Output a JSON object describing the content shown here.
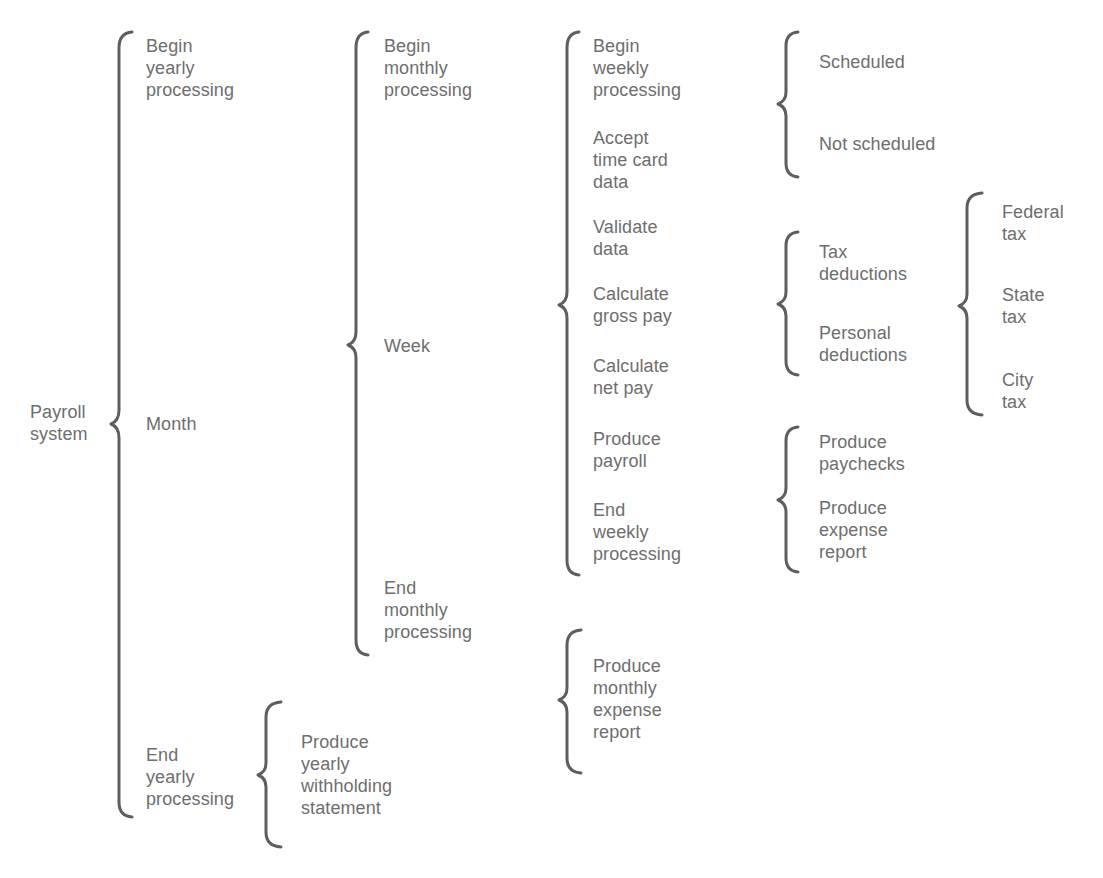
{
  "diagram": {
    "type": "Warnier-Orr diagram",
    "root": {
      "label": "Payroll\nsystem",
      "children": [
        {
          "label": "Begin\nyearly\nprocessing"
        },
        {
          "label": "Month",
          "children": [
            {
              "label": "Begin\nmonthly\nprocessing"
            },
            {
              "label": "Week",
              "children": [
                {
                  "label": "Begin\nweekly\nprocessing",
                  "children": [
                    {
                      "label": "Scheduled"
                    },
                    {
                      "label": "Not scheduled"
                    }
                  ]
                },
                {
                  "label": "Accept\ntime card\ndata"
                },
                {
                  "label": "Validate\ndata"
                },
                {
                  "label": "Calculate\ngross pay",
                  "children": [
                    {
                      "label": "Tax\ndeductions",
                      "children": [
                        {
                          "label": "Federal\ntax"
                        },
                        {
                          "label": "State\ntax"
                        },
                        {
                          "label": "City\ntax"
                        }
                      ]
                    },
                    {
                      "label": "Personal\ndeductions"
                    }
                  ]
                },
                {
                  "label": "Calculate\nnet pay"
                },
                {
                  "label": "Produce\npayroll",
                  "children": [
                    {
                      "label": "Produce\npaychecks"
                    },
                    {
                      "label": "Produce\nexpense\nreport"
                    }
                  ]
                },
                {
                  "label": "End\nweekly\nprocessing"
                }
              ]
            },
            {
              "label": "End\nmonthly\nprocessing",
              "children": [
                {
                  "label": "Produce\nmonthly\nexpense\nreport"
                }
              ]
            }
          ]
        },
        {
          "label": "End\nyearly\nprocessing",
          "children": [
            {
              "label": "Produce\nyearly\nwithholding\nstatement"
            }
          ]
        }
      ]
    }
  },
  "labels": {
    "payroll_system": "Payroll\nsystem",
    "begin_yearly": "Begin\nyearly\nprocessing",
    "month": "Month",
    "end_yearly": "End\nyearly\nprocessing",
    "begin_monthly": "Begin\nmonthly\nprocessing",
    "week": "Week",
    "end_monthly": "End\nmonthly\nprocessing",
    "yearly_withholding": "Produce\nyearly\nwithholding\nstatement",
    "begin_weekly": "Begin\nweekly\nprocessing",
    "accept_time_card": "Accept\ntime card\ndata",
    "validate_data": "Validate\ndata",
    "calc_gross": "Calculate\ngross pay",
    "calc_net": "Calculate\nnet pay",
    "produce_payroll": "Produce\npayroll",
    "end_weekly": "End\nweekly\nprocessing",
    "monthly_expense": "Produce\nmonthly\nexpense\nreport",
    "scheduled": "Scheduled",
    "not_scheduled": "Not scheduled",
    "tax_deductions": "Tax\ndeductions",
    "personal_deductions": "Personal\ndeductions",
    "produce_paychecks": "Produce\npaychecks",
    "produce_expense_report": "Produce\nexpense\nreport",
    "federal_tax": "Federal\ntax",
    "state_tax": "State\ntax",
    "city_tax": "City\ntax"
  },
  "colors": {
    "text": "#6e6e6e",
    "bracket": "#5e5e5e",
    "background": "#ffffff"
  }
}
